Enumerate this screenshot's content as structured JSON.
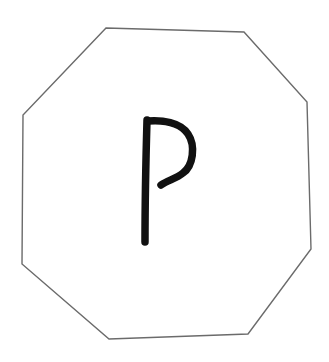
{
  "figure": {
    "background_color": "#ffffff",
    "shape": {
      "type": "octagon",
      "stroke_color": "#6b6b6b",
      "fill_color": "#ffffff",
      "stroke_width": 1.4,
      "points": "106,28 244,32 307,102 311,249 248,334 109,339 22,264 23,115"
    },
    "letter": {
      "text": "P",
      "color": "#111111",
      "stroke_width": 7.5,
      "stem_path": "M147,120 C146,155 145,200 145,242",
      "bowl_path": "M148,121 C162,120 180,122 188,134 C196,146 193,166 183,173 C176,179 168,180 161,185"
    }
  }
}
